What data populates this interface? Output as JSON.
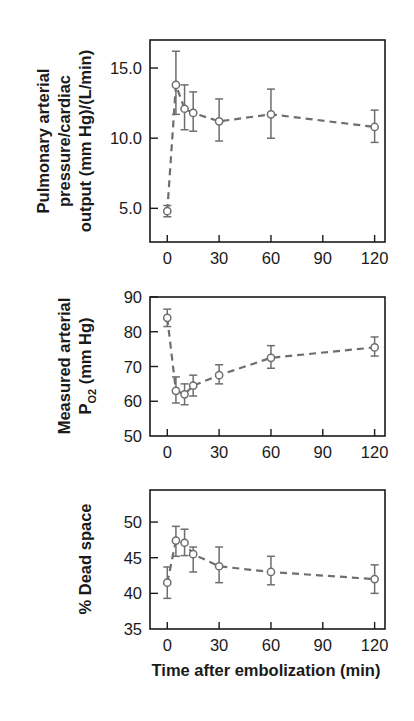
{
  "chart_data": [
    {
      "type": "line",
      "panel": "top",
      "title": "",
      "xlabel": "",
      "ylabel": "Pulmonary arterial pressure/cardiac output (mm Hg)/(L/min)",
      "ylabel_lines": [
        "Pulmonary arterial",
        "pressure/cardiac",
        "output (mm Hg)/(L/min)"
      ],
      "x": [
        0,
        5,
        10,
        15,
        30,
        60,
        120
      ],
      "series": [
        {
          "name": "PAP/CO",
          "values": [
            4.8,
            13.8,
            12.1,
            11.8,
            11.2,
            11.7,
            10.8
          ],
          "err_low": [
            4.4,
            11.7,
            10.6,
            10.5,
            9.8,
            10.0,
            9.7
          ],
          "err_high": [
            5.2,
            16.2,
            13.8,
            13.3,
            12.8,
            13.5,
            12.0
          ]
        }
      ],
      "xticks": [
        0,
        30,
        60,
        90,
        120
      ],
      "xtick_labels": [
        "0",
        "30",
        "60",
        "90",
        "120"
      ],
      "yticks": [
        5.0,
        10.0,
        15.0
      ],
      "ytick_labels": [
        "5.0",
        "10.0",
        "15.0"
      ],
      "xlim": [
        -10,
        126
      ],
      "ylim": [
        2.6,
        17.0
      ],
      "grid": false,
      "line_style": "dashed",
      "marker": "open-circle",
      "legend": null
    },
    {
      "type": "line",
      "panel": "middle",
      "title": "",
      "xlabel": "",
      "ylabel": "Measured arterial PO2 (mm Hg)",
      "ylabel_lines": [
        "Measured arterial",
        "P",
        "O2",
        " (mm Hg)"
      ],
      "x": [
        0,
        5,
        10,
        15,
        30,
        60,
        120
      ],
      "series": [
        {
          "name": "PaO2",
          "values": [
            84,
            63,
            62,
            64.5,
            67.5,
            72.5,
            75.5
          ],
          "err_low": [
            81.5,
            59.5,
            59,
            61.5,
            65,
            69.5,
            73
          ],
          "err_high": [
            86.5,
            67,
            65,
            67.5,
            70.5,
            76,
            78.5
          ]
        }
      ],
      "xticks": [
        0,
        30,
        60,
        90,
        120
      ],
      "xtick_labels": [
        "0",
        "30",
        "60",
        "90",
        "120"
      ],
      "yticks": [
        50,
        60,
        70,
        80,
        90
      ],
      "ytick_labels": [
        "50",
        "60",
        "70",
        "80",
        "90"
      ],
      "xlim": [
        -10,
        126
      ],
      "ylim": [
        50,
        90
      ],
      "grid": false,
      "line_style": "dashed",
      "marker": "open-circle",
      "legend": null
    },
    {
      "type": "line",
      "panel": "bottom",
      "title": "",
      "xlabel": "Time after embolization (min)",
      "ylabel": "% Dead space",
      "x": [
        0,
        5,
        10,
        15,
        30,
        60,
        120
      ],
      "series": [
        {
          "name": "Dead space",
          "values": [
            41.5,
            47.4,
            47.1,
            45.5,
            43.8,
            43.0,
            42.0
          ],
          "err_low": [
            39.3,
            45.2,
            45.3,
            43.0,
            41.5,
            41.2,
            40.0
          ],
          "err_high": [
            43.7,
            49.4,
            49.0,
            46.5,
            46.5,
            45.2,
            44.0
          ]
        }
      ],
      "xticks": [
        0,
        30,
        60,
        90,
        120
      ],
      "xtick_labels": [
        "0",
        "30",
        "60",
        "90",
        "120"
      ],
      "yticks": [
        35,
        40,
        45,
        50
      ],
      "ytick_labels": [
        "35",
        "40",
        "45",
        "50"
      ],
      "xlim": [
        -10,
        126
      ],
      "ylim": [
        35,
        54.5
      ],
      "grid": false,
      "line_style": "dashed",
      "marker": "open-circle",
      "legend": null
    }
  ],
  "figure": {
    "shared_xlabel": "Time after embolization (min)",
    "colors": {
      "data": "#6e6e6e",
      "axes": "#1a1a1a",
      "background": "#ffffff"
    }
  }
}
